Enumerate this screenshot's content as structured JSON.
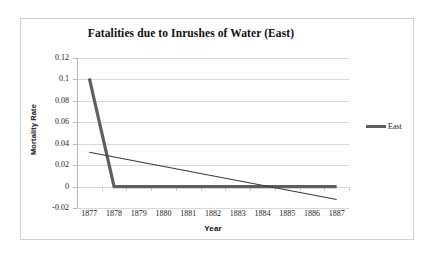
{
  "chart_data": {
    "type": "line",
    "title": "Fatalities due to Inrushes of Water (East)",
    "xlabel": "Year",
    "ylabel": "Mortality Rate",
    "categories": [
      "1877",
      "1878",
      "1879",
      "1880",
      "1881",
      "1882",
      "1883",
      "1884",
      "1885",
      "1886",
      "1887"
    ],
    "x": [
      1877,
      1878,
      1879,
      1880,
      1881,
      1882,
      1883,
      1884,
      1885,
      1886,
      1887
    ],
    "series": [
      {
        "name": "East",
        "color": "#5f5f5f",
        "values": [
          0.101,
          0,
          0,
          0,
          0,
          0,
          0,
          0,
          0,
          0,
          0
        ]
      }
    ],
    "trendline": {
      "name": "Linear (East)",
      "color": "#3a3a3a",
      "start_value": 0.032,
      "end_value": -0.012
    },
    "ylim": [
      -0.02,
      0.12
    ],
    "ytick_values": [
      0.12,
      0.1,
      0.08,
      0.06,
      0.04,
      0.02,
      0,
      -0.02
    ],
    "ytick_labels": [
      "0.12",
      "0.1",
      "0.08",
      "0.06",
      "0.04",
      "0.02",
      "0",
      "-0.02"
    ],
    "grid": true,
    "legend_position": "right",
    "legend_entries": [
      "East"
    ]
  },
  "legend": {
    "label": "East"
  }
}
